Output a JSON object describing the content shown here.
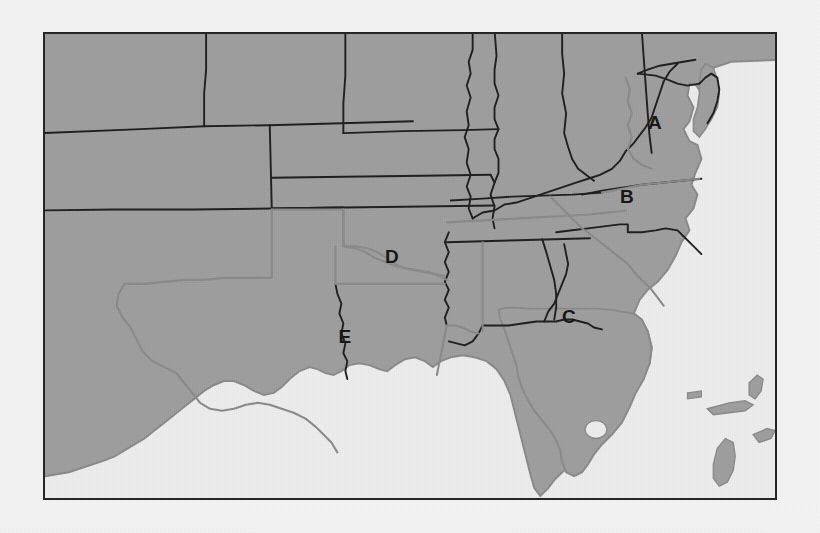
{
  "map": {
    "title": "Southeastern United States outline map",
    "frame": {
      "x": 43,
      "y": 32,
      "width": 734,
      "height": 468,
      "border_color": "#232323"
    },
    "colors": {
      "land": "#9e9e9e",
      "water": "#ededed",
      "page_background": "#f4f4f4",
      "state_border_dark": "#1d1d1d",
      "state_border_light": "#8a8a8a",
      "label_color": "#141414"
    },
    "labels": [
      {
        "id": "A",
        "text": "A",
        "x": 653,
        "y": 120,
        "region": "Virginia"
      },
      {
        "id": "B",
        "text": "B",
        "x": 625,
        "y": 194,
        "region": "North Carolina"
      },
      {
        "id": "C",
        "text": "C",
        "x": 567,
        "y": 314,
        "region": "Georgia"
      },
      {
        "id": "D",
        "text": "D",
        "x": 390,
        "y": 254,
        "region": "Arkansas"
      },
      {
        "id": "E",
        "text": "E",
        "x": 343,
        "y": 334,
        "region": "Texas-Louisiana border"
      }
    ],
    "features": {
      "lake_okeechobee": "Lake Okeechobee",
      "chesapeake_bay": "Chesapeake Bay",
      "gulf_of_mexico": "Gulf of Mexico",
      "atlantic_ocean": "Atlantic Ocean",
      "bahamas": "Bahama Islands"
    }
  }
}
